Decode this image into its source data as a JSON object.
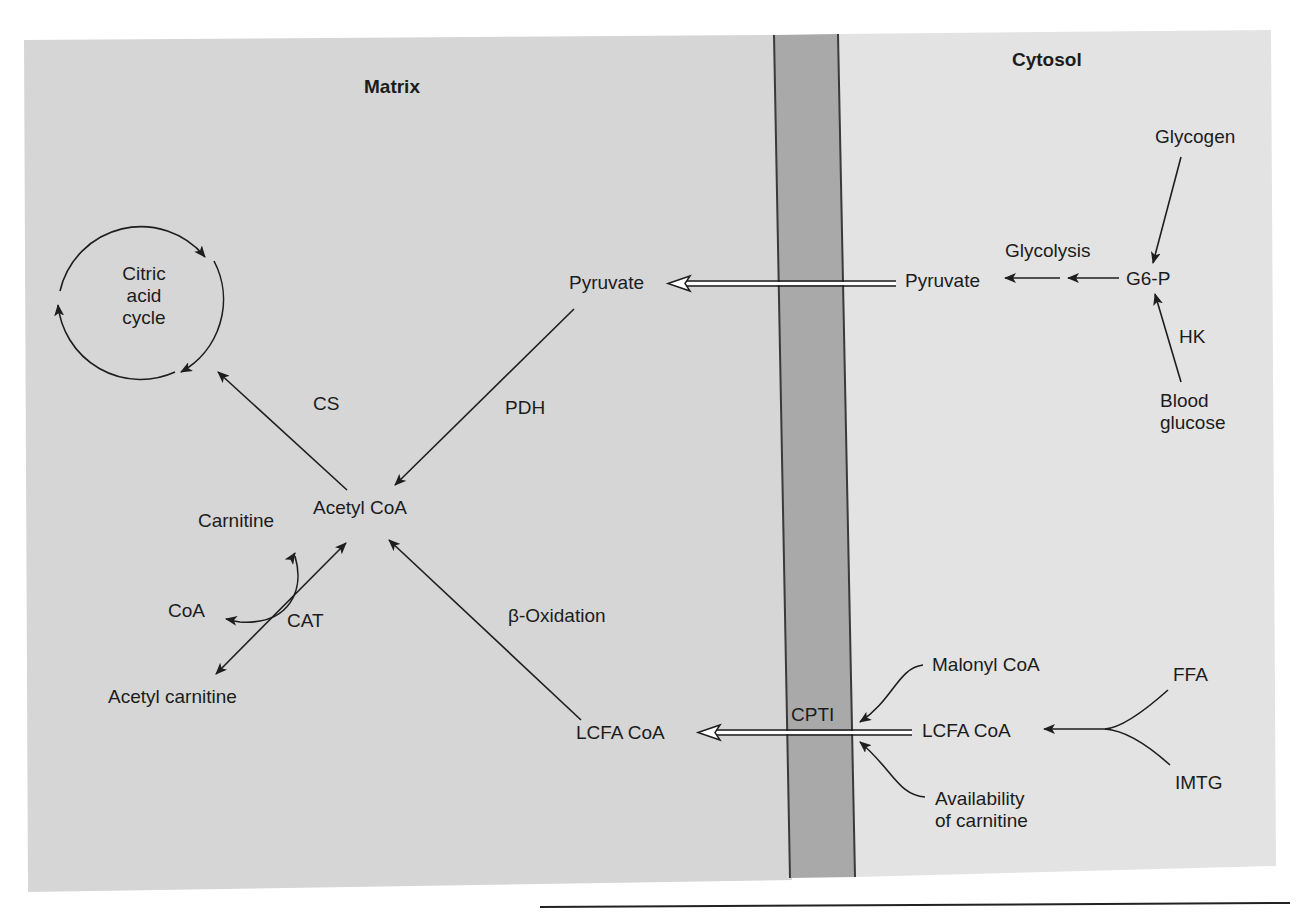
{
  "regions": {
    "matrix": {
      "title": "Matrix",
      "color": "#d6d6d6"
    },
    "cytosol": {
      "title": "Cytosol",
      "color": "#e3e3e3"
    },
    "membrane": {
      "color": "#a9a9a9",
      "edge_color": "#3a3a3a"
    }
  },
  "nodes": {
    "citric_acid_cycle": "Citric\nacid\ncycle",
    "acetyl_coa": "Acetyl CoA",
    "pyruvate_matrix": "Pyruvate",
    "carnitine": "Carnitine",
    "coa": "CoA",
    "acetyl_carnitine": "Acetyl carnitine",
    "lcfa_coa_matrix": "LCFA CoA",
    "pyruvate_cytosol": "Pyruvate",
    "g6p": "G6-P",
    "glycogen": "Glycogen",
    "blood_glucose": "Blood\nglucose",
    "lcfa_coa_cytosol": "LCFA CoA",
    "malonyl_coa": "Malonyl CoA",
    "availability_of_carnitine": "Availability\nof carnitine",
    "ffa": "FFA",
    "imtg": "IMTG"
  },
  "enzymes": {
    "cs": "CS",
    "pdh": "PDH",
    "cat": "CAT",
    "beta_oxidation": "β-Oxidation",
    "glycolysis": "Glycolysis",
    "hk": "HK",
    "cpt1": "CPTI"
  },
  "edges": [
    {
      "from": "Acetyl CoA",
      "to": "Citric acid cycle",
      "label": "CS"
    },
    {
      "from": "Pyruvate (matrix)",
      "to": "Acetyl CoA",
      "label": "PDH"
    },
    {
      "from": "LCFA CoA (matrix)",
      "to": "Acetyl CoA",
      "label": "β-Oxidation"
    },
    {
      "from": "Acetyl CoA",
      "to": "Acetyl carnitine",
      "label": "CAT",
      "bidirectional": true
    },
    {
      "from": "Carnitine",
      "to": "CoA",
      "label": "CAT (coupled)"
    },
    {
      "from": "Pyruvate (cytosol)",
      "to": "Pyruvate (matrix)",
      "type": "transport"
    },
    {
      "from": "G6-P",
      "to": "Pyruvate (cytosol)",
      "label": "Glycolysis"
    },
    {
      "from": "Glycogen",
      "to": "G6-P"
    },
    {
      "from": "Blood glucose",
      "to": "G6-P",
      "label": "HK"
    },
    {
      "from": "LCFA CoA (cytosol)",
      "to": "LCFA CoA (matrix)",
      "label": "CPTI",
      "type": "transport"
    },
    {
      "from": "FFA",
      "to": "LCFA CoA (cytosol)"
    },
    {
      "from": "IMTG",
      "to": "LCFA CoA (cytosol)"
    },
    {
      "from": "Malonyl CoA",
      "to": "CPTI",
      "type": "regulation"
    },
    {
      "from": "Availability of carnitine",
      "to": "CPTI",
      "type": "regulation"
    }
  ]
}
